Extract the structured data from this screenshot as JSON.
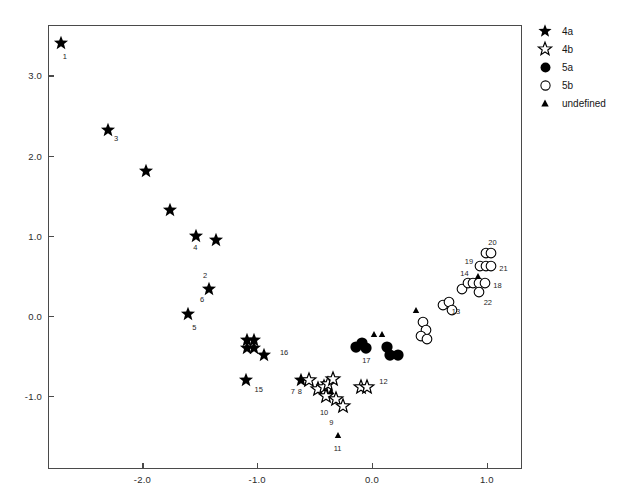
{
  "chart_data": {
    "type": "scatter",
    "title": "",
    "xlabel": "",
    "ylabel": "",
    "xlim": [
      -2.85,
      1.3
    ],
    "ylim": [
      -1.75,
      3.6
    ],
    "xticks": [
      -2.0,
      -1.0,
      0.0,
      1.0
    ],
    "xticklabels": [
      "-2.0",
      "-1.0",
      "0.0",
      "1.0"
    ],
    "yticks": [
      3.0,
      2.0,
      1.0,
      0.0,
      -1.0
    ],
    "yticklabels": [
      "3.0",
      "2.0",
      "1.0",
      "0.0",
      "-1.0"
    ],
    "grid": false,
    "legend_position": "outside right top",
    "series": [
      {
        "name": "4a",
        "marker": "filled-star",
        "points": [
          {
            "x": -2.71,
            "y": 3.4,
            "label": "1"
          },
          {
            "x": -2.3,
            "y": 2.32,
            "label": "3"
          },
          {
            "x": -1.97,
            "y": 1.81,
            "label": ""
          },
          {
            "x": -1.76,
            "y": 1.32,
            "label": ""
          },
          {
            "x": -1.53,
            "y": 1.0,
            "label": "4"
          },
          {
            "x": -1.36,
            "y": 0.95,
            "label": ""
          },
          {
            "x": -1.42,
            "y": 0.34,
            "label": "6"
          },
          {
            "x": -1.6,
            "y": 0.02,
            "label": "5"
          },
          {
            "x": -1.09,
            "y": -0.3,
            "label": ""
          },
          {
            "x": -1.03,
            "y": -0.3,
            "label": ""
          },
          {
            "x": -1.09,
            "y": -0.4,
            "label": ""
          },
          {
            "x": -1.03,
            "y": -0.4,
            "label": ""
          },
          {
            "x": -0.94,
            "y": -0.48,
            "label": "16"
          },
          {
            "x": -1.1,
            "y": -0.8,
            "label": "15"
          },
          {
            "x": -0.62,
            "y": -0.8,
            "label": "7"
          }
        ]
      },
      {
        "name": "4b",
        "marker": "open-star",
        "points": [
          {
            "x": -0.55,
            "y": -0.8,
            "label": "8"
          },
          {
            "x": -0.47,
            "y": -0.91,
            "label": ""
          },
          {
            "x": -0.42,
            "y": -0.88,
            "label": ""
          },
          {
            "x": -0.38,
            "y": -0.85,
            "label": ""
          },
          {
            "x": -0.34,
            "y": -0.78,
            "label": ""
          },
          {
            "x": -0.4,
            "y": -1.0,
            "label": "10"
          },
          {
            "x": -0.31,
            "y": -1.03,
            "label": "9"
          },
          {
            "x": -0.25,
            "y": -1.12,
            "label": ""
          },
          {
            "x": -0.1,
            "y": -0.88,
            "label": ""
          },
          {
            "x": -0.04,
            "y": -0.88,
            "label": "12"
          }
        ]
      },
      {
        "name": "5a",
        "marker": "filled-circle",
        "points": [
          {
            "x": -0.14,
            "y": -0.38,
            "label": ""
          },
          {
            "x": -0.09,
            "y": -0.33,
            "label": ""
          },
          {
            "x": -0.05,
            "y": -0.4,
            "label": "17"
          },
          {
            "x": 0.13,
            "y": -0.38,
            "label": ""
          },
          {
            "x": 0.16,
            "y": -0.48,
            "label": ""
          },
          {
            "x": 0.23,
            "y": -0.48,
            "label": ""
          }
        ]
      },
      {
        "name": "5b",
        "marker": "open-circle",
        "points": [
          {
            "x": 0.44,
            "y": -0.08,
            "label": ""
          },
          {
            "x": 0.47,
            "y": -0.18,
            "label": ""
          },
          {
            "x": 0.43,
            "y": -0.25,
            "label": ""
          },
          {
            "x": 0.48,
            "y": -0.28,
            "label": ""
          },
          {
            "x": 0.62,
            "y": 0.14,
            "label": ""
          },
          {
            "x": 0.67,
            "y": 0.18,
            "label": "13"
          },
          {
            "x": 0.7,
            "y": 0.08,
            "label": ""
          },
          {
            "x": 0.78,
            "y": 0.34,
            "label": ""
          },
          {
            "x": 0.84,
            "y": 0.41,
            "label": "14"
          },
          {
            "x": 0.88,
            "y": 0.41,
            "label": ""
          },
          {
            "x": 0.93,
            "y": 0.41,
            "label": ""
          },
          {
            "x": 0.98,
            "y": 0.41,
            "label": "18"
          },
          {
            "x": 0.93,
            "y": 0.3,
            "label": "22"
          },
          {
            "x": 0.94,
            "y": 0.62,
            "label": "19"
          },
          {
            "x": 0.99,
            "y": 0.62,
            "label": ""
          },
          {
            "x": 1.04,
            "y": 0.62,
            "label": "21"
          },
          {
            "x": 0.99,
            "y": 0.78,
            "label": ""
          },
          {
            "x": 1.04,
            "y": 0.78,
            "label": "20"
          }
        ]
      },
      {
        "name": "undefined",
        "marker": "filled-triangle",
        "points": [
          {
            "x": -0.36,
            "y": -0.93,
            "label": ""
          },
          {
            "x": 0.02,
            "y": -0.23,
            "label": ""
          },
          {
            "x": 0.09,
            "y": -0.23,
            "label": ""
          },
          {
            "x": 0.38,
            "y": 0.07,
            "label": ""
          },
          {
            "x": 0.92,
            "y": 0.5,
            "label": ""
          },
          {
            "x": -0.3,
            "y": -1.48,
            "label": "11"
          }
        ]
      }
    ]
  },
  "legend": {
    "items": [
      {
        "glyph": "filled-star-icon",
        "label": "4a"
      },
      {
        "glyph": "open-star-icon",
        "label": "4b"
      },
      {
        "glyph": "filled-circle-icon",
        "label": "5a"
      },
      {
        "glyph": "open-circle-icon",
        "label": "5b"
      },
      {
        "glyph": "filled-triangle-icon",
        "label": "undefined"
      }
    ]
  },
  "colors": {
    "marker": "#000000",
    "axis": "#4a4a4a",
    "background": "#ffffff",
    "text": "#111111"
  }
}
